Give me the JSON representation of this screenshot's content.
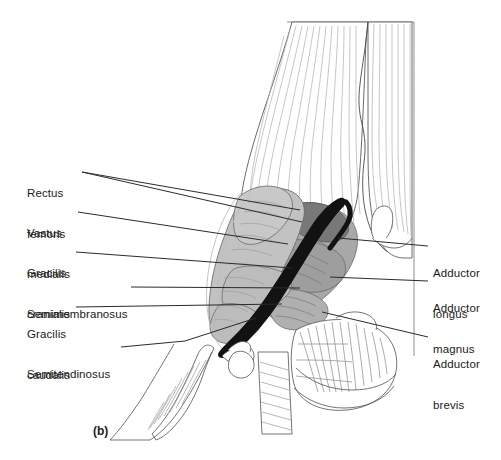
{
  "figure": {
    "caption": "(b)",
    "type": "anatomical-illustration",
    "background_color": "#ffffff",
    "line_color": "#3a3a3a",
    "leader_color": "#2b2b2b",
    "tones": {
      "outline_faint": "#9a9a9a",
      "muscle_light": "#c2c2c2",
      "muscle_mid": "#a8a8a8",
      "muscle_dark": "#7d7d7d",
      "tendon_black": "#121212",
      "frame": "#8f8f8f"
    }
  },
  "labels_left": [
    {
      "id": "rectus-femoris",
      "lines": [
        "Rectus",
        "femoris"
      ],
      "text": "Rectus femoris",
      "x": 27,
      "y": 166
    },
    {
      "id": "vastus-medialis",
      "lines": [
        "Vastus",
        "medialis"
      ],
      "text": "Vastus medialis",
      "x": 27,
      "y": 206
    },
    {
      "id": "gracilis-cranialis",
      "lines": [
        "Gracilis",
        "cranialis"
      ],
      "text": "Gracilis cranialis",
      "x": 27,
      "y": 246
    },
    {
      "id": "semimembranosus",
      "lines": [
        "Semimembranosus"
      ],
      "text": "Semimembranosus",
      "x": 27,
      "y": 281
    },
    {
      "id": "gracilis-caudalis",
      "lines": [
        "Gracilis",
        "caudalis"
      ],
      "text": "Gracilis caudalis",
      "x": 27,
      "y": 301
    },
    {
      "id": "semitendinosus",
      "lines": [
        "Semitendinosus"
      ],
      "text": "Semitendinosus",
      "x": 27,
      "y": 341
    }
  ],
  "labels_right": [
    {
      "id": "adductor-longus",
      "lines": [
        "Adductor",
        "longus"
      ],
      "text": "Adductor longus",
      "x": 433,
      "y": 240
    },
    {
      "id": "adductor-magnus",
      "lines": [
        "Adductor",
        "magnus"
      ],
      "text": "Adductor magnus",
      "x": 433,
      "y": 275
    },
    {
      "id": "adductor-brevis",
      "lines": [
        "Adductor",
        "brevis"
      ],
      "text": "Adductor brevis",
      "x": 433,
      "y": 331
    }
  ]
}
